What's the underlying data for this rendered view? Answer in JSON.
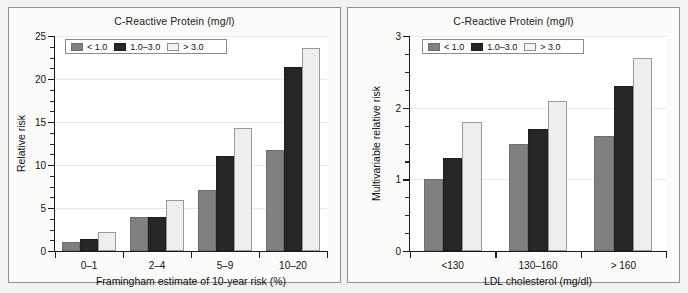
{
  "figure": {
    "background": "#f2f2f0",
    "panel_border": "#8f8f8f"
  },
  "series_colors": [
    "#808080",
    "#262626",
    "#eeeeec"
  ],
  "panels": [
    {
      "id": "left",
      "title": "C-Reactive Protein (mg/l)",
      "ylabel": "Relative risk",
      "xlabel": "Framingham estimate of 10-year risk (%)",
      "yticks": [
        "0",
        "5",
        "10",
        "15",
        "20",
        "25"
      ],
      "categories": [
        "0–1",
        "2–4",
        "5–9",
        "10–20"
      ],
      "legend": [
        "< 1.0",
        "1.0–3.0",
        "> 3.0"
      ]
    },
    {
      "id": "right",
      "title": "C-Reactive Protein (mg/l)",
      "ylabel": "Multivariable relative risk",
      "xlabel": "LDL cholesterol (mg/dl)",
      "yticks": [
        "0",
        "1",
        "2",
        "3"
      ],
      "categories": [
        "<130",
        "130–160",
        "> 160"
      ],
      "legend": [
        "< 1.0",
        "1.0–3.0",
        "> 3.0"
      ]
    }
  ],
  "chart_data": [
    {
      "type": "bar",
      "title": "C-Reactive Protein (mg/l)",
      "xlabel": "Framingham estimate of 10-year risk (%)",
      "ylabel": "Relative risk",
      "categories": [
        "0–1",
        "2–4",
        "5–9",
        "10–20"
      ],
      "ylim": [
        0,
        25
      ],
      "ytick_values": [
        0,
        5,
        10,
        15,
        20,
        25
      ],
      "minor_tick_step": 1.25,
      "grid": true,
      "legend_position": "top-left",
      "series": [
        {
          "name": "< 1.0",
          "values": [
            1.0,
            4.0,
            7.1,
            11.7
          ]
        },
        {
          "name": "1.0–3.0",
          "values": [
            1.4,
            3.9,
            11.1,
            21.4
          ]
        },
        {
          "name": "> 3.0",
          "values": [
            2.2,
            5.9,
            14.3,
            23.6
          ]
        }
      ]
    },
    {
      "type": "bar",
      "title": "C-Reactive Protein (mg/l)",
      "xlabel": "LDL cholesterol (mg/dl)",
      "ylabel": "Multivariable relative risk",
      "categories": [
        "<130",
        "130–160",
        "> 160"
      ],
      "ylim": [
        0,
        3
      ],
      "ytick_values": [
        0,
        1,
        2,
        3
      ],
      "minor_tick_step": 0.25,
      "grid": true,
      "legend_position": "top-left",
      "series": [
        {
          "name": "< 1.0",
          "values": [
            1.0,
            1.5,
            1.6
          ]
        },
        {
          "name": "1.0–3.0",
          "values": [
            1.3,
            1.7,
            2.3
          ]
        },
        {
          "name": "> 3.0",
          "values": [
            1.8,
            2.1,
            2.7
          ]
        }
      ]
    }
  ]
}
